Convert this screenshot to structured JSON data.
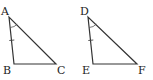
{
  "figure": {
    "triangles": [
      {
        "name": "ABC",
        "vertices": [
          {
            "label": "A",
            "x": 9,
            "y": 17
          },
          {
            "label": "B",
            "x": 14,
            "y": 64
          },
          {
            "label": "C",
            "x": 56,
            "y": 64
          }
        ],
        "angle_mark": "A",
        "tick_mark_side": "AB"
      },
      {
        "name": "DEF",
        "vertices": [
          {
            "label": "D",
            "x": 88,
            "y": 17
          },
          {
            "label": "E",
            "x": 93,
            "y": 64
          },
          {
            "label": "F",
            "x": 137,
            "y": 64
          }
        ],
        "angle_mark": "D",
        "tick_mark_side": "DE"
      }
    ],
    "colors": {
      "line": "#333333",
      "text": "#222222",
      "background": "#ffffff"
    }
  }
}
